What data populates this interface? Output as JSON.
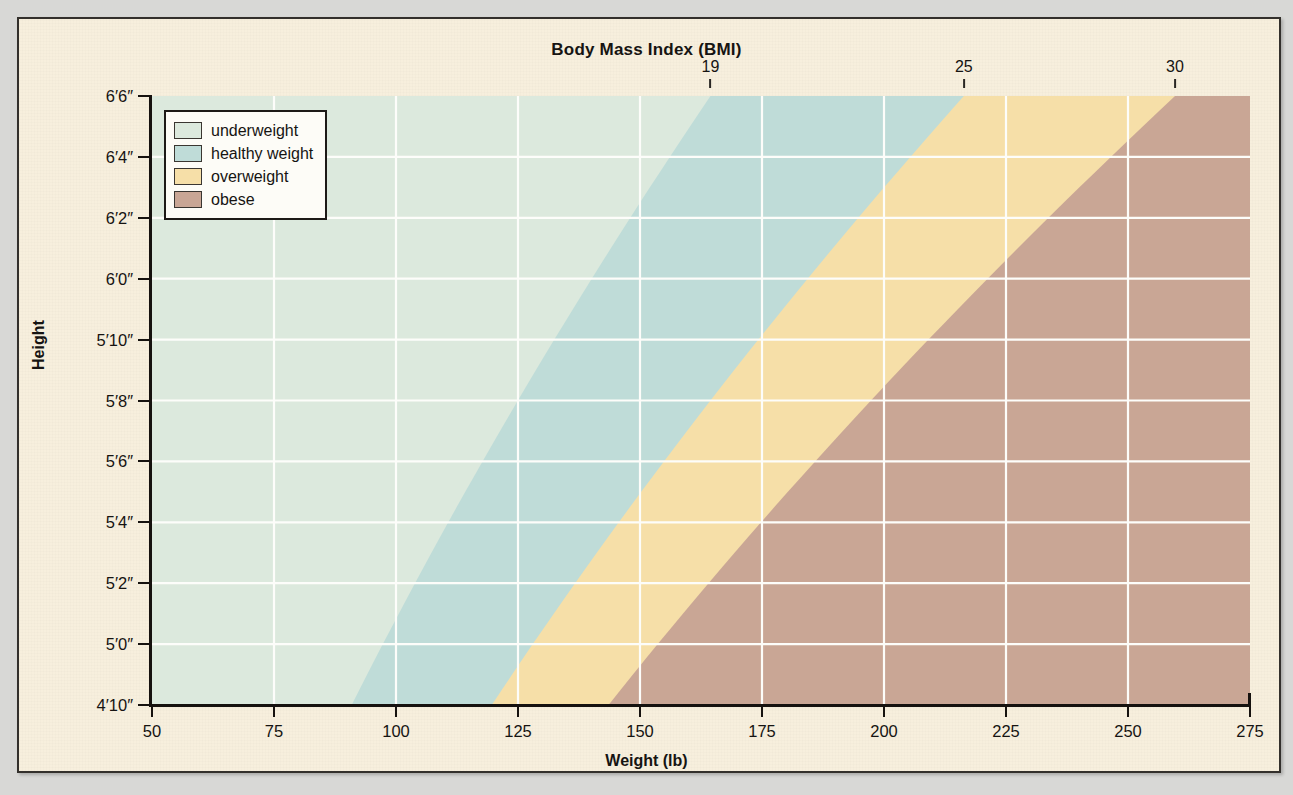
{
  "chart_data": {
    "type": "area",
    "title": "Body Mass Index (BMI)",
    "xlabel": "Weight (lb)",
    "ylabel": "Height",
    "xlim": [
      50,
      275
    ],
    "ylim": [
      58,
      78
    ],
    "grid": true,
    "legend_position": "top-left",
    "x_ticks": [
      "50",
      "75",
      "100",
      "125",
      "150",
      "175",
      "200",
      "225",
      "250",
      "275"
    ],
    "x_tick_values": [
      50,
      75,
      100,
      125,
      150,
      175,
      200,
      225,
      250,
      275
    ],
    "y_ticks": [
      "4′10″",
      "5′0″",
      "5′2″",
      "5′4″",
      "5′6″",
      "5′8″",
      "5′10″",
      "6′0″",
      "6′2″",
      "6′4″",
      "6′6″"
    ],
    "y_tick_inches": [
      58,
      60,
      62,
      64,
      66,
      68,
      70,
      72,
      74,
      76,
      78
    ],
    "top_axis_label": "Body Mass Index (BMI)",
    "bmi_ticks": [
      "19",
      "25",
      "30"
    ],
    "bmi_tick_values": [
      19,
      25,
      30
    ],
    "bmi_formula_constant": 703,
    "series": [
      {
        "name": "underweight",
        "bmi_range": [
          0,
          19
        ],
        "color": "#dce9dd",
        "boundary_weights_lb": {
          "58": 91.0,
          "60": 97.3,
          "62": 103.9,
          "64": 110.7,
          "66": 117.8,
          "68": 125.1,
          "70": 132.6,
          "72": 140.3,
          "74": 148.2,
          "76": 156.3,
          "78": 164.6
        }
      },
      {
        "name": "healthy weight",
        "bmi_range": [
          19,
          25
        ],
        "color": "#bfdcd8",
        "boundary_weights_lb": {
          "58": 119.7,
          "60": 128.0,
          "62": 136.7,
          "64": 145.7,
          "66": 155.0,
          "68": 164.6,
          "70": 174.4,
          "72": 184.6,
          "74": 195.0,
          "76": 205.7,
          "78": 216.6
        }
      },
      {
        "name": "overweight",
        "bmi_range": [
          25,
          30
        ],
        "color": "#f6dfa8",
        "boundary_weights_lb": {
          "58": 143.7,
          "60": 153.6,
          "62": 164.0,
          "64": 174.8,
          "66": 186.0,
          "68": 197.5,
          "70": 209.3,
          "72": 221.5,
          "74": 234.0,
          "76": 246.9,
          "78": 260.0
        }
      },
      {
        "name": "obese",
        "bmi_range": [
          30,
          null
        ],
        "color": "#c9a695",
        "boundary_weights_lb": {}
      }
    ]
  },
  "title": "Body Mass Index (BMI)",
  "axes": {
    "x_title": "Weight (lb)",
    "y_title": "Height",
    "x_labels": [
      "50",
      "75",
      "100",
      "125",
      "150",
      "175",
      "200",
      "225",
      "250",
      "275"
    ],
    "y_labels": [
      "6′6″",
      "6′4″",
      "6′2″",
      "6′0″",
      "5′10″",
      "5′8″",
      "5′6″",
      "5′4″",
      "5′2″",
      "5′0″",
      "4′10″"
    ],
    "bmi_labels": [
      "19",
      "25",
      "30"
    ]
  },
  "legend": {
    "items": [
      {
        "label": "underweight",
        "color": "#dce9dd"
      },
      {
        "label": "healthy weight",
        "color": "#bfdcd8"
      },
      {
        "label": "overweight",
        "color": "#f6dfa8"
      },
      {
        "label": "obese",
        "color": "#c9a695"
      }
    ]
  },
  "colors": {
    "page": "#f7efdd",
    "frame": "#33302c",
    "backdrop": "#d8d8d6",
    "gridline": "#fdfdfa",
    "text": "#161412"
  }
}
